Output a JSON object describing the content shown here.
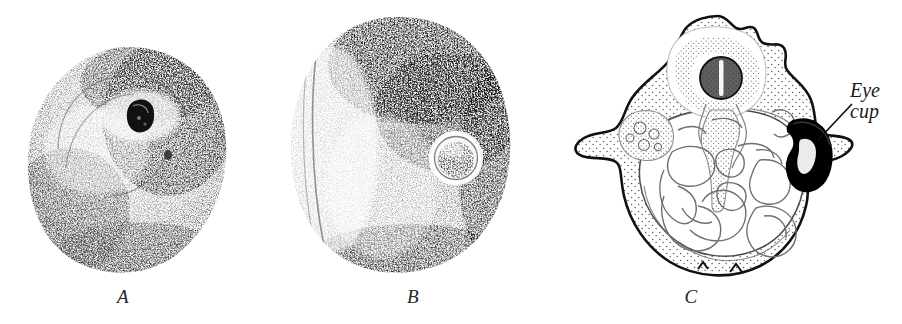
{
  "figure": {
    "type": "scientific-illustration-plate",
    "background_color": "#ffffff",
    "ink_color": "#1a1a1a",
    "panels": [
      {
        "id": "A",
        "label": "A",
        "style": "stipple",
        "description": "Surface view of rounded embryo with small dark eye pigment spot",
        "features": [
          {
            "name": "eye-pigment-spot",
            "color": "#111111"
          },
          {
            "name": "body-outline"
          },
          {
            "name": "optic-groove"
          }
        ]
      },
      {
        "id": "B",
        "label": "B",
        "style": "stipple",
        "description": "Surface view of larger ovoid embryo with circular optic vesicle",
        "features": [
          {
            "name": "optic-vesicle-ring"
          },
          {
            "name": "body-outline"
          },
          {
            "name": "lateral-fold"
          }
        ]
      },
      {
        "id": "C",
        "label": "C",
        "style": "line-drawing-stipple",
        "description": "Transverse section through embryo showing internal organs and pigmented eye cup",
        "features": [
          {
            "name": "eye-cup",
            "color": "#000000"
          },
          {
            "name": "notochord"
          },
          {
            "name": "gut-coils"
          },
          {
            "name": "dorsal-vesicle"
          },
          {
            "name": "yolk-mass"
          }
        ],
        "callouts": [
          {
            "name": "eye-cup-callout",
            "text": "Eye\ncup"
          }
        ]
      }
    ]
  }
}
